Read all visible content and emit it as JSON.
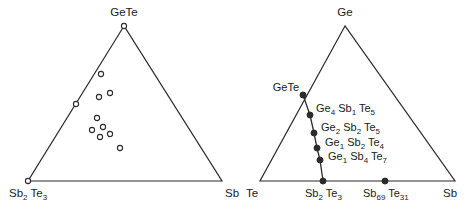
{
  "figure": {
    "background_color": "#ffffff",
    "line_color": "#2b2b2b",
    "text_color": "#1a1a1a"
  },
  "chart_data": {
    "type": "scatter",
    "title": "",
    "panels": [
      {
        "id": "left-panel",
        "name": "pseudo-ternary-sb2te3-gete-sb",
        "type": "ternary-scatter",
        "marker_style": "open-circle",
        "vertices": [
          {
            "name": "apex",
            "label": "GeTe",
            "x": 124,
            "y": 26,
            "label_x": 124,
            "label_y": 16,
            "anchor": "middle",
            "marker": "open-circle"
          },
          {
            "name": "bottom-left",
            "label": "Sb2Te3",
            "label_parts": [
              {
                "t": "Sb",
                "sub": false
              },
              {
                "t": "2",
                "sub": true
              },
              {
                "t": " Te",
                "sub": false
              },
              {
                "t": "3",
                "sub": true
              }
            ],
            "x": 28,
            "y": 181,
            "label_x": 9,
            "label_y": 197,
            "anchor": "start",
            "marker": "open-circle"
          },
          {
            "name": "bottom-right",
            "label": "Sb",
            "x": 222,
            "y": 181,
            "label_x": 225,
            "label_y": 197,
            "anchor": "start",
            "marker": "none"
          }
        ],
        "edge_points": [
          {
            "x": 101,
            "y": 74,
            "marker": "open-circle",
            "on_edge": "gete-sb2te3"
          },
          {
            "x": 76,
            "y": 104,
            "marker": "open-circle",
            "on_edge": "gete-sb2te3"
          }
        ],
        "interior_points": [
          {
            "x": 110,
            "y": 93,
            "marker": "open-circle"
          },
          {
            "x": 99,
            "y": 97,
            "marker": "open-circle"
          },
          {
            "x": 97,
            "y": 118,
            "marker": "open-circle"
          },
          {
            "x": 92,
            "y": 130,
            "marker": "open-circle"
          },
          {
            "x": 103,
            "y": 127,
            "marker": "open-circle"
          },
          {
            "x": 100,
            "y": 137,
            "marker": "open-circle"
          },
          {
            "x": 110,
            "y": 134,
            "marker": "open-circle"
          },
          {
            "x": 120,
            "y": 148,
            "marker": "open-circle"
          }
        ]
      },
      {
        "id": "right-panel",
        "name": "ternary-te-ge-sb",
        "type": "ternary-tieline",
        "marker_style": "filled-circle",
        "vertices": [
          {
            "name": "apex",
            "label": "Ge",
            "x": 345,
            "y": 26,
            "label_x": 345,
            "label_y": 16,
            "anchor": "middle",
            "marker": "none"
          },
          {
            "name": "bottom-left",
            "label": "Te",
            "x": 260,
            "y": 181,
            "label_x": 246,
            "label_y": 197,
            "anchor": "start",
            "marker": "none"
          },
          {
            "name": "bottom-right",
            "label": "Sb",
            "x": 455,
            "y": 181,
            "label_x": 443,
            "label_y": 197,
            "anchor": "start",
            "marker": "none"
          }
        ],
        "tie_line": {
          "from": "GeTe",
          "to": "Sb2Te3",
          "path": [
            {
              "x": 303,
              "y": 95
            },
            {
              "x": 310,
              "y": 115
            },
            {
              "x": 314,
              "y": 133
            },
            {
              "x": 317,
              "y": 148
            },
            {
              "x": 320,
              "y": 160
            },
            {
              "x": 323,
              "y": 181
            }
          ]
        },
        "tie_points": [
          {
            "x": 303,
            "y": 95,
            "marker": "filled-circle",
            "label": "GeTe",
            "label_parts": [
              {
                "t": "GeTe",
                "sub": false
              }
            ],
            "label_x": 299,
            "label_y": 91,
            "anchor": "end"
          },
          {
            "x": 310,
            "y": 115,
            "marker": "filled-circle",
            "label": "Ge4 Sb1 Te5",
            "label_parts": [
              {
                "t": "Ge",
                "sub": false
              },
              {
                "t": "4",
                "sub": true
              },
              {
                "t": " Sb",
                "sub": false
              },
              {
                "t": "1",
                "sub": true
              },
              {
                "t": " Te",
                "sub": false
              },
              {
                "t": "5",
                "sub": true
              }
            ],
            "label_x": 316,
            "label_y": 112,
            "anchor": "start"
          },
          {
            "x": 314,
            "y": 133,
            "marker": "filled-circle",
            "label": "Ge2 Sb2 Te5",
            "label_parts": [
              {
                "t": "Ge",
                "sub": false
              },
              {
                "t": "2",
                "sub": true
              },
              {
                "t": " Sb",
                "sub": false
              },
              {
                "t": "2",
                "sub": true
              },
              {
                "t": " Te",
                "sub": false
              },
              {
                "t": "5",
                "sub": true
              }
            ],
            "label_x": 321,
            "label_y": 131,
            "anchor": "start"
          },
          {
            "x": 317,
            "y": 148,
            "marker": "filled-circle",
            "label": "Ge1 Sb2 Te4",
            "label_parts": [
              {
                "t": "Ge",
                "sub": false
              },
              {
                "t": "1",
                "sub": true
              },
              {
                "t": " Sb",
                "sub": false
              },
              {
                "t": "2",
                "sub": true
              },
              {
                "t": " Te",
                "sub": false
              },
              {
                "t": "4",
                "sub": true
              }
            ],
            "label_x": 325,
            "label_y": 146,
            "anchor": "start"
          },
          {
            "x": 320,
            "y": 160,
            "marker": "filled-circle",
            "label": "Ge1 Sb4 Te7",
            "label_parts": [
              {
                "t": "Ge",
                "sub": false
              },
              {
                "t": "1",
                "sub": true
              },
              {
                "t": " Sb",
                "sub": false
              },
              {
                "t": "4",
                "sub": true
              },
              {
                "t": " Te",
                "sub": false
              },
              {
                "t": "7",
                "sub": true
              }
            ],
            "label_x": 328,
            "label_y": 160,
            "anchor": "start"
          },
          {
            "x": 323,
            "y": 181,
            "marker": "filled-circle",
            "label": "Sb2 Te3",
            "label_parts": [
              {
                "t": "Sb",
                "sub": false
              },
              {
                "t": "2",
                "sub": true
              },
              {
                "t": " Te",
                "sub": false
              },
              {
                "t": "3",
                "sub": true
              }
            ],
            "label_x": 305,
            "label_y": 197,
            "anchor": "start"
          }
        ],
        "baseline_points": [
          {
            "x": 385,
            "y": 181,
            "marker": "filled-circle",
            "label": "Sb69 Te31",
            "label_parts": [
              {
                "t": "Sb",
                "sub": false
              },
              {
                "t": "69",
                "sub": true
              },
              {
                "t": " Te",
                "sub": false
              },
              {
                "t": "31",
                "sub": true
              }
            ],
            "label_x": 363,
            "label_y": 197,
            "anchor": "start"
          }
        ]
      }
    ]
  }
}
